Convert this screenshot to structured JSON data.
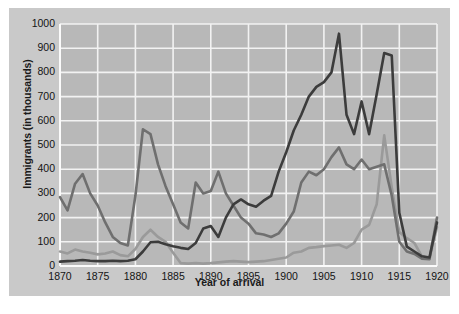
{
  "chart_data": {
    "type": "line",
    "title": "",
    "xlabel": "Year of arrival",
    "ylabel": "Immigrants (in thousands)",
    "xlim": [
      1870,
      1920
    ],
    "ylim": [
      0,
      1000
    ],
    "xticks": [
      1870,
      1875,
      1880,
      1885,
      1890,
      1895,
      1900,
      1905,
      1910,
      1915,
      1920
    ],
    "yticks": [
      0,
      100,
      200,
      300,
      400,
      500,
      600,
      700,
      800,
      900,
      1000
    ],
    "grid": true,
    "legend": "none",
    "x": [
      1870,
      1871,
      1872,
      1873,
      1874,
      1875,
      1876,
      1877,
      1878,
      1879,
      1880,
      1881,
      1882,
      1883,
      1884,
      1885,
      1886,
      1887,
      1888,
      1889,
      1890,
      1891,
      1892,
      1893,
      1894,
      1895,
      1896,
      1897,
      1898,
      1899,
      1900,
      1901,
      1902,
      1903,
      1904,
      1905,
      1906,
      1907,
      1908,
      1909,
      1910,
      1911,
      1912,
      1913,
      1914,
      1915,
      1916,
      1917,
      1918,
      1919,
      1920
    ],
    "series": [
      {
        "name": "northwestern-europe",
        "color": "#6f6f6f",
        "values": [
          285,
          230,
          340,
          380,
          300,
          250,
          180,
          120,
          95,
          85,
          290,
          565,
          545,
          420,
          330,
          255,
          180,
          155,
          345,
          300,
          310,
          390,
          300,
          250,
          200,
          175,
          135,
          130,
          120,
          135,
          175,
          225,
          345,
          390,
          375,
          400,
          450,
          490,
          420,
          400,
          440,
          400,
          410,
          420,
          290,
          100,
          60,
          50,
          30,
          28,
          200
        ]
      },
      {
        "name": "southern-eastern-europe",
        "color": "#3c3c3c",
        "values": [
          18,
          20,
          22,
          25,
          22,
          20,
          20,
          22,
          20,
          22,
          28,
          60,
          98,
          100,
          90,
          82,
          75,
          70,
          95,
          155,
          165,
          120,
          200,
          255,
          275,
          255,
          245,
          270,
          290,
          390,
          470,
          560,
          625,
          700,
          740,
          760,
          800,
          960,
          625,
          545,
          680,
          545,
          710,
          880,
          870,
          220,
          80,
          60,
          40,
          35,
          180
        ]
      },
      {
        "name": "other-regions",
        "color": "#9a9a9a",
        "values": [
          60,
          52,
          68,
          60,
          55,
          48,
          52,
          60,
          45,
          40,
          70,
          120,
          150,
          120,
          100,
          55,
          12,
          10,
          12,
          10,
          12,
          15,
          18,
          20,
          18,
          16,
          18,
          20,
          25,
          30,
          35,
          55,
          60,
          75,
          78,
          82,
          85,
          88,
          75,
          95,
          150,
          170,
          255,
          540,
          325,
          140,
          115,
          95,
          40,
          30,
          160
        ]
      }
    ]
  },
  "axis_text": {
    "y_label": "Immigrants (in thousands)",
    "x_label": "Year of arrival"
  }
}
